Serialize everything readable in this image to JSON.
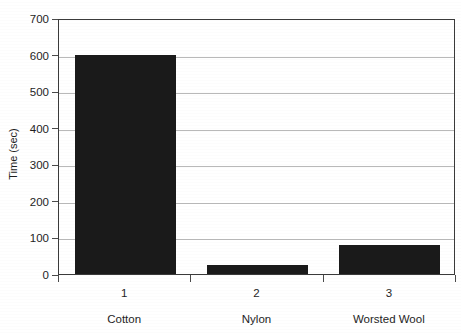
{
  "chart_data": {
    "type": "bar",
    "title": "",
    "subtitle": "",
    "xlabel": "",
    "ylabel": "Time (sec)",
    "categories": [
      "1",
      "2",
      "3"
    ],
    "category_names": [
      "Cotton",
      "Nylon",
      "Worsted Wool"
    ],
    "values": [
      600,
      25,
      80
    ],
    "ylim": [
      0,
      700
    ],
    "ytick_labels": [
      "0",
      "100",
      "200",
      "300",
      "400",
      "500",
      "600",
      "700"
    ],
    "ytick_values": [
      0,
      100,
      200,
      300,
      400,
      500,
      600,
      700
    ],
    "grid": true,
    "grid_axis": "y",
    "legend": false,
    "legend_position": "none",
    "bar_color": "#1a1a1a",
    "grid_color": "#b9b9b9",
    "axis_color": "#3a3a3a",
    "background_color": "#ffffff"
  },
  "axes": {
    "y_title": "Time (sec)"
  }
}
